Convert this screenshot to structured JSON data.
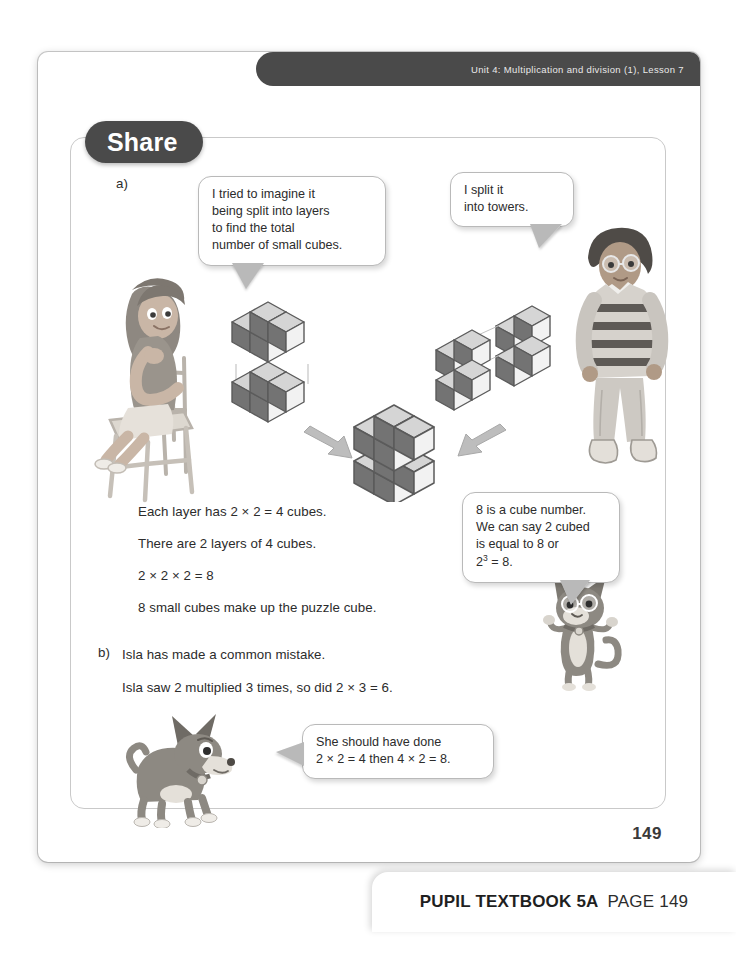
{
  "header": {
    "unit_label": "Unit 4: Multiplication and division (1), Lesson 7"
  },
  "section": {
    "title": "Share"
  },
  "parts": {
    "a_label": "a)",
    "b_label": "b)"
  },
  "bubbles": {
    "girl": {
      "line1": "I tried to imagine it",
      "line2": "being split into layers",
      "line3": "to find the total",
      "line4": "number of small cubes."
    },
    "boy": {
      "line1": "I split it",
      "line2": "into towers."
    },
    "cat": {
      "line1": "8 is a cube number.",
      "line2": "We can say 2 cubed",
      "line3": "is equal to 8 or",
      "line4_pre": "2",
      "line4_sup": "3",
      "line4_post": " = 8."
    },
    "dog": {
      "line1": "She should have done",
      "line2": "2 × 2 = 4 then 4 × 2 = 8."
    }
  },
  "working": {
    "line1": "Each layer has 2 × 2 = 4 cubes.",
    "line2": "There are 2 layers of 4 cubes.",
    "line3": "2 × 2 × 2 = 8",
    "line4": "8 small cubes make up the puzzle cube."
  },
  "part_b": {
    "line1": "Isla has made a common mistake.",
    "line2": "Isla saw 2 multiplied 3 times, so did 2 × 3 = 6."
  },
  "page": {
    "number": "149"
  },
  "footer": {
    "book": "PUPIL TEXTBOOK 5A",
    "page_ref": "PAGE 149"
  },
  "colors": {
    "header_bar": "#4a4a4a",
    "pill": "#4a4a4a",
    "frame_border": "#c9c9c9",
    "text": "#2c2c2c",
    "cube_dark": "#6f6f6f",
    "cube_light": "#d8d8d8",
    "arrow": "#b0b0b0"
  }
}
